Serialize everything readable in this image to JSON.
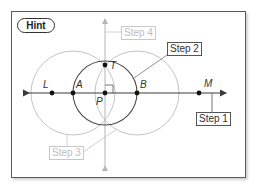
{
  "hint_label": "Hint",
  "steps": {
    "step1": "Step 1",
    "step2": "Step 2",
    "step3": "Step 3",
    "step4": "Step 4"
  },
  "points": {
    "L": "L",
    "A": "A",
    "P": "P",
    "B": "B",
    "M": "M",
    "T": "T"
  },
  "colors": {
    "dark_stroke": "#3a3a3a",
    "light_stroke": "#c4c4c4",
    "frame": "#5a5a5a"
  }
}
